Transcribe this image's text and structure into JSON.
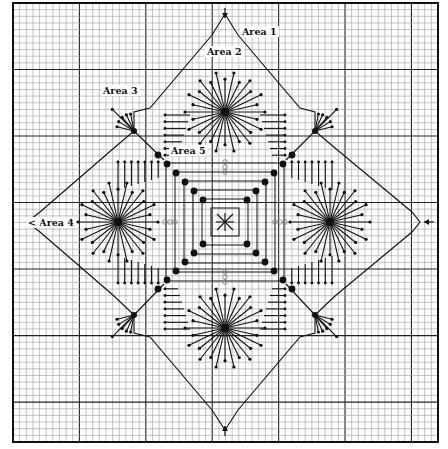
{
  "diagram": {
    "type": "needlepoint-chart",
    "background": "#ffffff",
    "ink_color": "#111111",
    "grid": {
      "cells_x": 64,
      "cells_y": 66,
      "major_every": 10,
      "minor_color": "#9a9a9a",
      "major_color": "#222222"
    },
    "labels": [
      {
        "id": "area1",
        "text": "Area 1"
      },
      {
        "id": "area2",
        "text": "Area 2"
      },
      {
        "id": "area3",
        "text": "Area 3"
      },
      {
        "id": "area4",
        "text": "Area 4"
      },
      {
        "id": "area5",
        "text": "Area 5"
      }
    ],
    "arrows": [
      "top-center",
      "left-center",
      "right-center",
      "bottom-center"
    ],
    "motifs": {
      "stars": [
        "top",
        "bottom",
        "left",
        "right"
      ],
      "fans": [
        "top-left",
        "top-right",
        "bottom-left",
        "bottom-right"
      ],
      "center": "cross-star",
      "diagonal_beads": 24
    }
  }
}
